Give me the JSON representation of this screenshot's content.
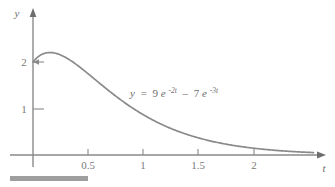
{
  "figure": {
    "background_color": "#ffffff",
    "line_color": "#8a8a8a",
    "axis_color": "#8a8a8a",
    "text_color": "#6e6e6e"
  },
  "axes": {
    "y_axis_label": "y",
    "x_axis_label": "t",
    "y_ticks": [
      {
        "value": 1,
        "label": "1"
      },
      {
        "value": 2,
        "label": "2"
      }
    ],
    "x_ticks": [
      {
        "value": 0.5,
        "label": "0.5"
      },
      {
        "value": 1,
        "label": "1"
      },
      {
        "value": 1.5,
        "label": "1.5"
      },
      {
        "value": 2,
        "label": "2"
      }
    ]
  },
  "annotation": {
    "equation_full": "y = 9e^(-2t) - 7e^(-3t)",
    "lhs": "y",
    "equals": "=",
    "coef1": "9",
    "base1": "e",
    "exp1": "-2t",
    "minus": "–",
    "coef2": "7",
    "base2": "e",
    "exp2": "-3t"
  },
  "chart_data": {
    "type": "line",
    "title": "",
    "xlabel": "t",
    "ylabel": "y",
    "xlim": [
      -0.05,
      2.55
    ],
    "ylim": [
      -0.12,
      2.7
    ],
    "grid": false,
    "legend": null,
    "annotations": [
      {
        "text": "y = 9e^(-2t) - 7e^(-3t)",
        "x": 1.0,
        "y": 1.45
      },
      {
        "text": "2",
        "x": 0.0,
        "y": 2.0,
        "note": "y-intercept marker with leader tick to curve start"
      }
    ],
    "series": [
      {
        "name": "y = 9e^(-2t) - 7e^(-3t)",
        "color": "#8a8a8a",
        "x": [
          0,
          0.05,
          0.1,
          0.15,
          0.2,
          0.25,
          0.3,
          0.35,
          0.4,
          0.45,
          0.5,
          0.6,
          0.7,
          0.8,
          0.9,
          1.0,
          1.1,
          1.2,
          1.3,
          1.4,
          1.5,
          1.6,
          1.7,
          1.8,
          1.9,
          2.0,
          2.1,
          2.2,
          2.3,
          2.4,
          2.5
        ],
        "values": [
          2.0,
          2.121,
          2.186,
          2.209,
          2.2,
          2.169,
          2.12,
          2.061,
          1.995,
          1.925,
          1.851,
          1.699,
          1.549,
          1.406,
          1.271,
          1.145,
          1.03,
          0.925,
          0.829,
          0.743,
          0.665,
          0.594,
          0.531,
          0.474,
          0.423,
          0.377,
          0.336,
          0.299,
          0.267,
          0.238,
          0.212
        ],
        "peak": {
          "x": 0.1438,
          "y": 2.2099
        },
        "y_intercept": 2.0
      }
    ]
  },
  "decoration": {
    "bottom_bar_name": "page-rule-bar"
  }
}
